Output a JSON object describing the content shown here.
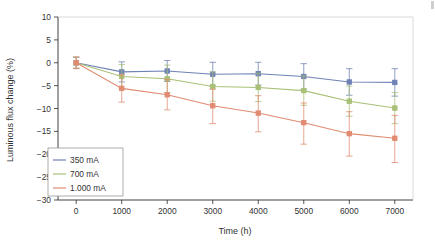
{
  "chart_data": {
    "type": "line",
    "title": "",
    "xlabel": "Time (h)",
    "ylabel": "Luminous flux change (%)",
    "x": [
      0,
      1000,
      2000,
      3000,
      4000,
      5000,
      6000,
      7000
    ],
    "xlim": [
      -400,
      7400
    ],
    "ylim": [
      -30,
      10
    ],
    "xticks": [
      0,
      1000,
      2000,
      3000,
      4000,
      5000,
      6000,
      7000
    ],
    "xticklabels": [
      "0",
      "1000",
      "2000",
      "3000",
      "4000",
      "5000",
      "6000",
      "7000"
    ],
    "yticks": [
      10,
      5,
      0,
      -5,
      -10,
      -15,
      -20,
      -25,
      -30
    ],
    "yticklabels": [
      "10",
      "5",
      "0",
      "−5",
      "−10",
      "−15",
      "−20",
      "−25",
      "−30"
    ],
    "grid": false,
    "legend_position": "lower left",
    "error_bars": true,
    "marker": "square",
    "series": [
      {
        "name": "350 mA",
        "color": "#6f82b5",
        "values": [
          0.0,
          -2.0,
          -1.8,
          -2.5,
          -2.4,
          -3.0,
          -4.2,
          -4.3
        ],
        "err_upper": [
          1.2,
          2.2,
          2.3,
          2.6,
          2.5,
          2.8,
          2.9,
          3.0
        ],
        "err_lower": [
          1.2,
          2.2,
          2.3,
          2.6,
          2.5,
          2.8,
          2.9,
          3.0
        ]
      },
      {
        "name": "700 mA",
        "color": "#a9c077",
        "values": [
          0.0,
          -3.0,
          -3.5,
          -5.2,
          -5.4,
          -6.1,
          -8.4,
          -9.9
        ],
        "err_upper": [
          1.2,
          2.6,
          3.0,
          3.2,
          3.1,
          3.2,
          3.3,
          3.4
        ],
        "err_lower": [
          1.2,
          2.6,
          3.0,
          3.2,
          3.1,
          3.2,
          3.3,
          3.4
        ]
      },
      {
        "name": "1.000 mA",
        "color": "#e18b72",
        "values": [
          0.0,
          -5.6,
          -7.0,
          -9.4,
          -11.0,
          -13.1,
          -15.5,
          -16.5
        ],
        "err_upper": [
          1.3,
          3.0,
          3.3,
          3.6,
          3.8,
          4.3,
          4.8,
          5.0
        ],
        "err_lower": [
          1.3,
          3.0,
          3.3,
          3.9,
          4.1,
          4.7,
          4.9,
          5.3
        ]
      }
    ],
    "legend": [
      {
        "label": "350 mA",
        "color": "#6f82b5"
      },
      {
        "label": "700 mA",
        "color": "#a9c077"
      },
      {
        "label": "1.000 mA",
        "color": "#e18b72"
      }
    ]
  }
}
